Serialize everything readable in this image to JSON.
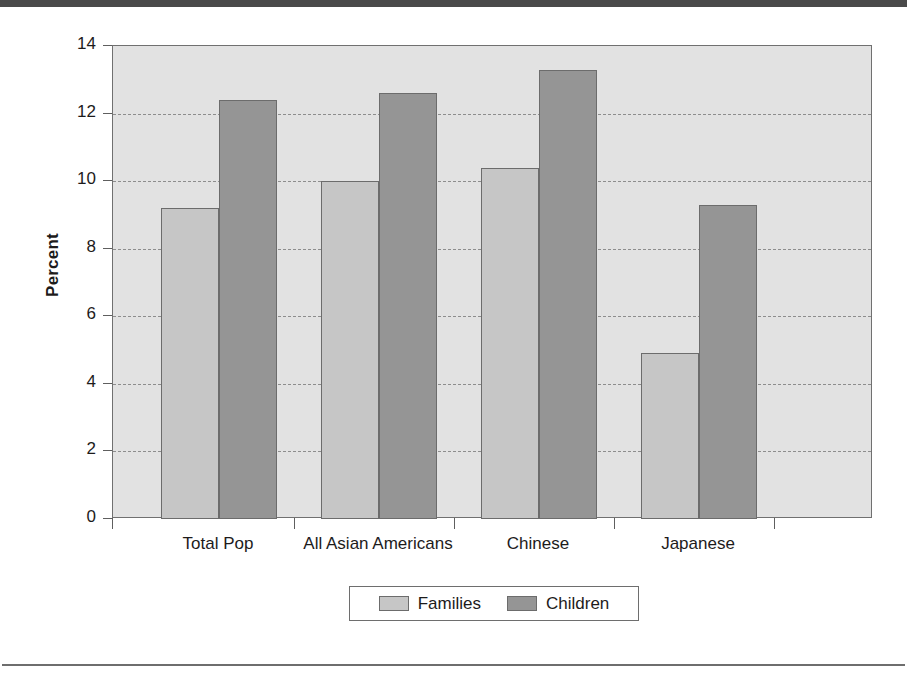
{
  "chart_data": {
    "type": "bar",
    "title": "",
    "xlabel": "",
    "ylabel": "Percent",
    "ylim": [
      0,
      14
    ],
    "ytick_step": 2,
    "grid": true,
    "grid_style": "dashed-horizontal",
    "legend_position": "bottom-center",
    "categories": [
      "Total Pop",
      "All Asian Americans",
      "Chinese",
      "Japanese"
    ],
    "series": [
      {
        "name": "Families",
        "color": "#c6c6c6",
        "values": [
          9.2,
          10.0,
          10.4,
          4.9
        ]
      },
      {
        "name": "Children",
        "color": "#959595",
        "values": [
          12.4,
          12.6,
          13.3,
          9.3
        ]
      }
    ],
    "ytick_labels": [
      "0",
      "2",
      "4",
      "6",
      "8",
      "10",
      "12",
      "14"
    ],
    "plot_background": "#e2e2e2",
    "axis_color": "#707070"
  },
  "legend": {
    "entries": [
      {
        "label": "Families"
      },
      {
        "label": "Children"
      }
    ]
  }
}
